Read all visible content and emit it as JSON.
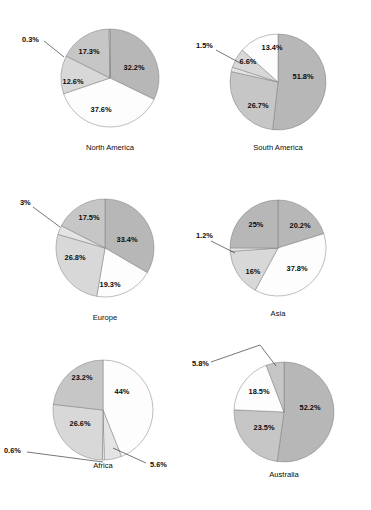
{
  "figure": {
    "title": "",
    "background_color": "#ffffff",
    "layout": {
      "rows": 3,
      "cols": 2,
      "cell_width": 185,
      "cell_height": 170
    }
  },
  "palette": {
    "dark_gray": "#b7b7b7",
    "mid_gray": "#c6c6c6",
    "light_gray": "#d8d8d8",
    "pale_gray": "#e4e4e4",
    "white": "#fdfdfd",
    "outline": "#7d7d7d",
    "text": "#0b0b0b",
    "leader_line": "#2b2b2b"
  },
  "chart_data": [
    {
      "type": "pie",
      "title": "North America",
      "labels": [
        "32.2%",
        "37.6%",
        "12.6%",
        "17.3%",
        "0.3%"
      ],
      "values": [
        32.2,
        37.6,
        12.6,
        17.3,
        0.3
      ],
      "colors": [
        "#b7b7b7",
        "#fdfdfd",
        "#d8d8d8",
        "#c6c6c6",
        "#e4e4e4"
      ],
      "start_angle_deg": 0,
      "direction": "clockwise",
      "callouts": [
        "0.3%"
      ],
      "legend": "none",
      "cell": {
        "row": 0,
        "col": 0
      }
    },
    {
      "type": "pie",
      "title": "South America",
      "labels": [
        "51.8%",
        "26.7%",
        "1.5%",
        "6.6%",
        "13.4%"
      ],
      "values": [
        51.8,
        26.7,
        1.5,
        6.6,
        13.4
      ],
      "colors": [
        "#b7b7b7",
        "#c6c6c6",
        "#e4e4e4",
        "#d8d8d8",
        "#fdfdfd"
      ],
      "start_angle_deg": 0,
      "direction": "clockwise",
      "callouts": [
        "1.5%"
      ],
      "legend": "none",
      "cell": {
        "row": 0,
        "col": 1
      }
    },
    {
      "type": "pie",
      "title": "Europe",
      "labels": [
        "33.4%",
        "19.3%",
        "26.8%",
        "3%",
        "17.5%"
      ],
      "values": [
        33.4,
        19.3,
        26.8,
        3.0,
        17.5
      ],
      "colors": [
        "#b7b7b7",
        "#fdfdfd",
        "#d8d8d8",
        "#e4e4e4",
        "#c6c6c6"
      ],
      "start_angle_deg": 0,
      "direction": "clockwise",
      "callouts": [
        "3%"
      ],
      "legend": "none",
      "cell": {
        "row": 1,
        "col": 0
      }
    },
    {
      "type": "pie",
      "title": "Asia",
      "labels": [
        "20.2%",
        "37.8%",
        "16%",
        "1.2%",
        "25%"
      ],
      "values": [
        20.2,
        37.8,
        16.0,
        1.2,
        25.0
      ],
      "colors": [
        "#b7b7b7",
        "#fdfdfd",
        "#d8d8d8",
        "#e4e4e4",
        "#b7b7b7"
      ],
      "start_angle_deg": 0,
      "direction": "clockwise",
      "callouts": [
        "1.2%"
      ],
      "legend": "none",
      "cell": {
        "row": 1,
        "col": 1
      }
    },
    {
      "type": "pie",
      "title": "Africa",
      "labels": [
        "44%",
        "5.6%",
        "0.6%",
        "26.6%",
        "23.2%"
      ],
      "values": [
        44.0,
        5.6,
        0.6,
        26.6,
        23.2
      ],
      "colors": [
        "#fdfdfd",
        "#e4e4e4",
        "#f2f2f2",
        "#d8d8d8",
        "#c6c6c6"
      ],
      "start_angle_deg": 0,
      "direction": "clockwise",
      "callouts": [
        "5.6%",
        "0.6%"
      ],
      "legend": "none",
      "cell": {
        "row": 2,
        "col": 0
      }
    },
    {
      "type": "pie",
      "title": "Australia",
      "labels": [
        "52.2%",
        "23.5%",
        "18.5%",
        "5.8%"
      ],
      "values": [
        52.2,
        23.5,
        18.5,
        5.8
      ],
      "colors": [
        "#b7b7b7",
        "#c6c6c6",
        "#fdfdfd",
        "#c6c6c6"
      ],
      "start_angle_deg": 0,
      "direction": "clockwise",
      "callouts": [
        "5.8%"
      ],
      "legend": "none",
      "cell": {
        "row": 2,
        "col": 1
      }
    }
  ],
  "charts_meta": [
    {
      "name": "north-america",
      "center": [
        110,
        78
      ],
      "radius": 49,
      "title_xy": [
        110,
        148
      ],
      "slice_geometry": [
        {
          "label": "32.2%",
          "label_xy": [
            134,
            68
          ],
          "inside": true
        },
        {
          "label": "37.6%",
          "label_xy": [
            101,
            110
          ],
          "inside": true
        },
        {
          "label": "12.6%",
          "label_xy": [
            73,
            82
          ],
          "inside": true
        },
        {
          "label": "17.3%",
          "label_xy": [
            89,
            52
          ],
          "inside": true
        },
        {
          "label": "0.3%",
          "label_xy": [
            22,
            40
          ],
          "inside": false,
          "leader": [
            [
              44,
              41
            ],
            [
              64,
              57
            ]
          ]
        }
      ]
    },
    {
      "name": "south-america",
      "center": [
        278,
        82
      ],
      "radius": 48,
      "title_xy": [
        278,
        148
      ],
      "slice_geometry": [
        {
          "label": "51.8%",
          "label_xy": [
            303,
            77
          ],
          "inside": true
        },
        {
          "label": "26.7%",
          "label_xy": [
            258,
            106
          ],
          "inside": true
        },
        {
          "label": "1.5%",
          "label_xy": [
            196,
            46
          ],
          "inside": false,
          "leader": [
            [
              216,
              50
            ],
            [
              240,
              63
            ]
          ]
        },
        {
          "label": "6.6%",
          "label_xy": [
            248,
            62
          ],
          "inside": true
        },
        {
          "label": "13.4%",
          "label_xy": [
            272,
            48
          ],
          "inside": true
        }
      ]
    },
    {
      "name": "europe",
      "center": [
        105,
        248
      ],
      "radius": 49,
      "title_xy": [
        105,
        318
      ],
      "slice_geometry": [
        {
          "label": "33.4%",
          "label_xy": [
            127,
            240
          ],
          "inside": true
        },
        {
          "label": "19.3%",
          "label_xy": [
            110,
            285
          ],
          "inside": true
        },
        {
          "label": "26.8%",
          "label_xy": [
            75,
            258
          ],
          "inside": true
        },
        {
          "label": "3%",
          "label_xy": [
            20,
            203
          ],
          "inside": false,
          "leader": [
            [
              33,
              207
            ],
            [
              60,
              227
            ]
          ]
        },
        {
          "label": "17.5%",
          "label_xy": [
            89,
            218
          ],
          "inside": true
        }
      ]
    },
    {
      "name": "asia",
      "center": [
        278,
        248
      ],
      "radius": 48,
      "title_xy": [
        278,
        314
      ],
      "slice_geometry": [
        {
          "label": "20.2%",
          "label_xy": [
            300,
            226
          ],
          "inside": true
        },
        {
          "label": "37.8%",
          "label_xy": [
            297,
            269
          ],
          "inside": true
        },
        {
          "label": "16%",
          "label_xy": [
            253,
            272
          ],
          "inside": true
        },
        {
          "label": "1.2%",
          "label_xy": [
            196,
            236
          ],
          "inside": false,
          "leader": [
            [
              211,
              241
            ],
            [
              235,
              253
            ]
          ]
        },
        {
          "label": "25%",
          "label_xy": [
            256,
            225
          ],
          "inside": true
        }
      ]
    },
    {
      "name": "africa",
      "center": [
        103,
        410
      ],
      "radius": 50,
      "title_xy": [
        103,
        466
      ],
      "slice_geometry": [
        {
          "label": "44%",
          "label_xy": [
            122,
            392
          ],
          "inside": true
        },
        {
          "label": "5.6%",
          "label_xy": [
            150,
            465
          ],
          "inside": false,
          "leader": [
            [
              146,
              463
            ],
            [
              113,
              448
            ]
          ]
        },
        {
          "label": "0.6%",
          "label_xy": [
            4,
            451
          ],
          "inside": false,
          "leader": [
            [
              27,
              452
            ],
            [
              103,
              462
            ]
          ]
        },
        {
          "label": "26.6%",
          "label_xy": [
            80,
            424
          ],
          "inside": true
        },
        {
          "label": "23.2%",
          "label_xy": [
            82,
            378
          ],
          "inside": true
        }
      ]
    },
    {
      "name": "australia",
      "center": [
        284,
        412
      ],
      "radius": 50,
      "title_xy": [
        284,
        475
      ],
      "slice_geometry": [
        {
          "label": "52.2%",
          "label_xy": [
            310,
            408
          ],
          "inside": true
        },
        {
          "label": "23.5%",
          "label_xy": [
            264,
            428
          ],
          "inside": true
        },
        {
          "label": "18.5%",
          "label_xy": [
            259,
            392
          ],
          "inside": true
        },
        {
          "label": "5.8%",
          "label_xy": [
            192,
            364
          ],
          "inside": false,
          "leader": [
            [
              211,
              362
            ],
            [
              260,
              345
            ],
            [
              276,
              366
            ]
          ]
        }
      ]
    }
  ]
}
